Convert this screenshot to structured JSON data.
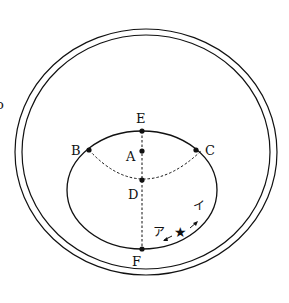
{
  "diagram": {
    "points": {
      "A": "A",
      "B": "B",
      "C": "C",
      "D": "D",
      "E": "E",
      "F": "F"
    },
    "directions": {
      "a": "ア",
      "i": "イ"
    },
    "marker": "★",
    "edge_fragment": "o",
    "colors": {
      "stroke": "#111111",
      "background": "#ffffff"
    }
  }
}
